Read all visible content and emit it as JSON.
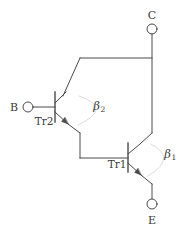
{
  "figure": {
    "kind": "circuit-schematic",
    "stroke_color": "#4a4a4a",
    "text_color": "#3b3b3b",
    "background_color": "#ffffff"
  },
  "terminals": [
    {
      "id": "collector",
      "label": "C",
      "x": 152,
      "y": 29,
      "label_x": 152,
      "label_y": 15
    },
    {
      "id": "base",
      "label": "B",
      "x": 28,
      "y": 107,
      "label_x": 14,
      "label_y": 107
    },
    {
      "id": "emitter",
      "label": "E",
      "x": 152,
      "y": 204,
      "label_x": 152,
      "label_y": 220
    }
  ],
  "devices": [
    {
      "id": "tr2",
      "label": "Tr2",
      "label_x": 44,
      "label_y": 121,
      "base_bar_x": 55,
      "base_bar_y1": 92,
      "base_bar_y2": 122
    },
    {
      "id": "tr1",
      "label": "Tr1",
      "label_x": 117,
      "label_y": 164,
      "base_bar_x": 128,
      "base_bar_y1": 143,
      "base_bar_y2": 172
    }
  ],
  "gain_labels": [
    {
      "id": "beta2",
      "symbol": "β",
      "subscript": "2",
      "x": 99,
      "y": 107
    },
    {
      "id": "beta1",
      "symbol": "β",
      "subscript": "1",
      "x": 170,
      "y": 155
    }
  ]
}
